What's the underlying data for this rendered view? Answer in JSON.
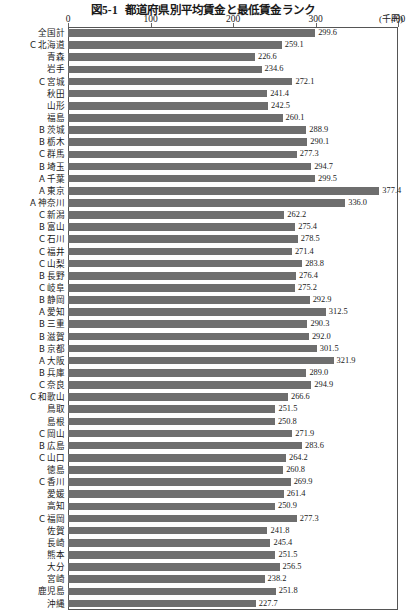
{
  "title": {
    "figure_no": "図5-1",
    "text": "都道府県別平均賃金と最低賃金ランク"
  },
  "unit_label": "(千円)",
  "chart_data": {
    "type": "bar",
    "orientation": "horizontal",
    "xlabel": "",
    "ylabel": "",
    "unit": "千円",
    "xlim": [
      0,
      400
    ],
    "xticks": [
      0,
      100,
      200,
      300,
      400
    ],
    "grid": false,
    "legend": null,
    "bar_color": "#6e6e6e",
    "categories": [
      "全国計",
      "北海道",
      "青森",
      "岩手",
      "宮城",
      "秋田",
      "山形",
      "福島",
      "茨城",
      "栃木",
      "群馬",
      "埼玉",
      "千葉",
      "東京",
      "神奈川",
      "新潟",
      "富山",
      "石川",
      "福井",
      "山梨",
      "長野",
      "岐阜",
      "静岡",
      "愛知",
      "三重",
      "滋賀",
      "京都",
      "大阪",
      "兵庫",
      "奈良",
      "和歌山",
      "鳥取",
      "島根",
      "岡山",
      "広島",
      "山口",
      "徳島",
      "香川",
      "愛媛",
      "高知",
      "福岡",
      "佐賀",
      "長崎",
      "熊本",
      "大分",
      "宮崎",
      "鹿児島",
      "沖縄"
    ],
    "values": [
      299.6,
      259.1,
      226.6,
      234.6,
      272.1,
      241.4,
      242.5,
      260.1,
      288.9,
      290.1,
      277.3,
      294.7,
      299.5,
      377.4,
      336.0,
      262.2,
      275.4,
      278.5,
      271.4,
      283.8,
      276.4,
      275.2,
      292.9,
      312.5,
      290.3,
      292.0,
      301.5,
      321.9,
      289.0,
      294.9,
      266.6,
      251.5,
      250.8,
      271.9,
      283.6,
      264.2,
      260.8,
      269.9,
      261.4,
      250.9,
      277.3,
      241.8,
      245.4,
      251.5,
      256.5,
      238.2,
      251.8,
      227.7
    ],
    "ranks": [
      "",
      "C",
      "",
      "",
      "C",
      "",
      "",
      "",
      "B",
      "B",
      "C",
      "B",
      "A",
      "A",
      "A",
      "C",
      "B",
      "C",
      "C",
      "C",
      "B",
      "C",
      "B",
      "A",
      "B",
      "B",
      "B",
      "A",
      "B",
      "C",
      "C",
      "",
      "",
      "C",
      "B",
      "C",
      "",
      "C",
      "",
      "",
      "C",
      "",
      "",
      "",
      "",
      "",
      "",
      ""
    ],
    "rows": [
      {
        "rank": "",
        "name": "全国計",
        "value": 299.6
      },
      {
        "rank": "C",
        "name": "北海道",
        "value": 259.1
      },
      {
        "rank": "",
        "name": "青森",
        "value": 226.6
      },
      {
        "rank": "",
        "name": "岩手",
        "value": 234.6
      },
      {
        "rank": "C",
        "name": "宮城",
        "value": 272.1
      },
      {
        "rank": "",
        "name": "秋田",
        "value": 241.4
      },
      {
        "rank": "",
        "name": "山形",
        "value": 242.5
      },
      {
        "rank": "",
        "name": "福島",
        "value": 260.1
      },
      {
        "rank": "B",
        "name": "茨城",
        "value": 288.9
      },
      {
        "rank": "B",
        "name": "栃木",
        "value": 290.1
      },
      {
        "rank": "C",
        "name": "群馬",
        "value": 277.3
      },
      {
        "rank": "B",
        "name": "埼玉",
        "value": 294.7
      },
      {
        "rank": "A",
        "name": "千葉",
        "value": 299.5
      },
      {
        "rank": "A",
        "name": "東京",
        "value": 377.4
      },
      {
        "rank": "A",
        "name": "神奈川",
        "value": 336.0
      },
      {
        "rank": "C",
        "name": "新潟",
        "value": 262.2
      },
      {
        "rank": "B",
        "name": "富山",
        "value": 275.4
      },
      {
        "rank": "C",
        "name": "石川",
        "value": 278.5
      },
      {
        "rank": "C",
        "name": "福井",
        "value": 271.4
      },
      {
        "rank": "C",
        "name": "山梨",
        "value": 283.8
      },
      {
        "rank": "B",
        "name": "長野",
        "value": 276.4
      },
      {
        "rank": "C",
        "name": "岐阜",
        "value": 275.2
      },
      {
        "rank": "B",
        "name": "静岡",
        "value": 292.9
      },
      {
        "rank": "A",
        "name": "愛知",
        "value": 312.5
      },
      {
        "rank": "B",
        "name": "三重",
        "value": 290.3
      },
      {
        "rank": "B",
        "name": "滋賀",
        "value": 292.0
      },
      {
        "rank": "B",
        "name": "京都",
        "value": 301.5
      },
      {
        "rank": "A",
        "name": "大阪",
        "value": 321.9
      },
      {
        "rank": "B",
        "name": "兵庫",
        "value": 289.0
      },
      {
        "rank": "C",
        "name": "奈良",
        "value": 294.9
      },
      {
        "rank": "C",
        "name": "和歌山",
        "value": 266.6
      },
      {
        "rank": "",
        "name": "鳥取",
        "value": 251.5
      },
      {
        "rank": "",
        "name": "島根",
        "value": 250.8
      },
      {
        "rank": "C",
        "name": "岡山",
        "value": 271.9
      },
      {
        "rank": "B",
        "name": "広島",
        "value": 283.6
      },
      {
        "rank": "C",
        "name": "山口",
        "value": 264.2
      },
      {
        "rank": "",
        "name": "徳島",
        "value": 260.8
      },
      {
        "rank": "C",
        "name": "香川",
        "value": 269.9
      },
      {
        "rank": "",
        "name": "愛媛",
        "value": 261.4
      },
      {
        "rank": "",
        "name": "高知",
        "value": 250.9
      },
      {
        "rank": "C",
        "name": "福岡",
        "value": 277.3
      },
      {
        "rank": "",
        "name": "佐賀",
        "value": 241.8
      },
      {
        "rank": "",
        "name": "長崎",
        "value": 245.4
      },
      {
        "rank": "",
        "name": "熊本",
        "value": 251.5
      },
      {
        "rank": "",
        "name": "大分",
        "value": 256.5
      },
      {
        "rank": "",
        "name": "宮崎",
        "value": 238.2
      },
      {
        "rank": "",
        "name": "鹿児島",
        "value": 251.8
      },
      {
        "rank": "",
        "name": "沖縄",
        "value": 227.7
      }
    ]
  }
}
